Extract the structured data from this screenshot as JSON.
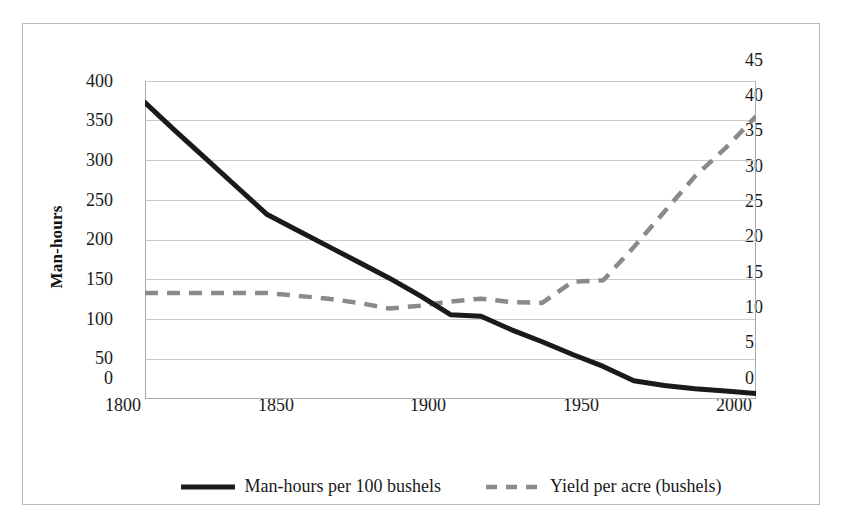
{
  "figure": {
    "background_color": "#ffffff",
    "frame_color": "#b8b8b8",
    "gridline_color": "#c9c9c9",
    "axis_line_color": "#aaaaaa"
  },
  "axes": {
    "x": {
      "label": "",
      "ticks": [
        "1800",
        "1850",
        "1900",
        "1950",
        "2000"
      ],
      "min": 1800,
      "max": 2000
    },
    "y_left": {
      "title": "Man-hours",
      "ticks": [
        "0",
        "50",
        "100",
        "150",
        "200",
        "250",
        "300",
        "350",
        "400"
      ],
      "min": 0,
      "max": 400
    },
    "y_right": {
      "title": "Yield per acre (bushels)",
      "ticks": [
        "0",
        "5",
        "10",
        "15",
        "20",
        "25",
        "30",
        "35",
        "40",
        "45"
      ],
      "min": 0,
      "max": 45
    }
  },
  "legend": {
    "position": "bottom",
    "entries": [
      {
        "label": "Man-hours per 100 bushels",
        "color": "#1a1a1a",
        "style": "solid"
      },
      {
        "label": "Yield per acre (bushels)",
        "color": "#8a8a8a",
        "style": "dashed"
      }
    ]
  },
  "chart_data": {
    "type": "line",
    "title": "",
    "xlabel": "",
    "ylabel": "Man-hours",
    "y2label": "Yield per acre (bushels)",
    "xlim": [
      1800,
      2000
    ],
    "ylim": [
      0,
      400
    ],
    "y2lim": [
      0,
      45
    ],
    "grid": true,
    "legend_position": "bottom",
    "x": [
      1800,
      1810,
      1820,
      1830,
      1840,
      1850,
      1860,
      1870,
      1880,
      1890,
      1900,
      1910,
      1920,
      1930,
      1940,
      1950,
      1960,
      1970,
      1980,
      1990,
      2000
    ],
    "series": [
      {
        "name": "Man-hours per 100 bushels",
        "axis": "left",
        "color": "#1a1a1a",
        "style": "solid",
        "values": [
          373,
          337,
          302,
          267,
          232,
          212,
          192,
          172,
          152,
          130,
          106,
          104,
          87,
          72,
          56,
          41,
          23,
          17,
          13,
          10,
          7
        ]
      },
      {
        "name": "Yield per acre (bushels)",
        "axis": "right",
        "color": "#8a8a8a",
        "style": "dashed",
        "values": [
          15,
          15,
          15,
          15,
          15,
          14.6,
          14.2,
          13.6,
          12.8,
          13.2,
          13.8,
          14.2,
          13.7,
          13.6,
          16.6,
          16.8,
          21.5,
          26.5,
          31.5,
          35.5,
          40
        ]
      }
    ]
  }
}
